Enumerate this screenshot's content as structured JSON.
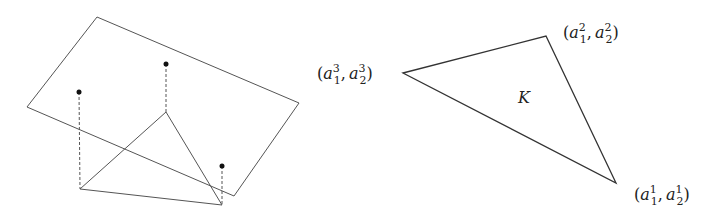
{
  "figure": {
    "left_panel": {
      "description": "plane in 3D with triangle below and three lifted points connected by dashed lines",
      "plane_corners": [
        [
          97,
          17
        ],
        [
          299,
          103
        ],
        [
          234,
          196
        ],
        [
          27,
          107
        ]
      ],
      "triangle_vertices": [
        [
          166,
          112
        ],
        [
          80,
          189
        ],
        [
          222,
          205
        ]
      ],
      "lifted_points": [
        {
          "point": [
            79,
            92
          ],
          "base": [
            80,
            189
          ]
        },
        {
          "point": [
            166,
            64
          ],
          "base": [
            166,
            112
          ]
        },
        {
          "point": [
            222,
            166
          ],
          "base": [
            222,
            205
          ]
        }
      ],
      "stroke_color": "#555555",
      "point_color": "#111111"
    },
    "right_panel": {
      "triangle_vertices": [
        [
          403,
          73
        ],
        [
          546,
          36
        ],
        [
          616,
          183
        ]
      ],
      "region_label": "K",
      "vertex_labels": [
        {
          "id": "v3",
          "base": "a",
          "sub1": "1",
          "sup1": "3",
          "sub2": "2",
          "sup2": "3"
        },
        {
          "id": "v2",
          "base": "a",
          "sub1": "1",
          "sup1": "2",
          "sub2": "2",
          "sup2": "2"
        },
        {
          "id": "v1",
          "base": "a",
          "sub1": "1",
          "sup1": "1",
          "sub2": "2",
          "sup2": "1"
        }
      ],
      "stroke_color": "#333333"
    }
  },
  "labels": {
    "K": "K",
    "open": "(",
    "close": ")",
    "comma": ",",
    "a": "a",
    "v3": {
      "sup1": "3",
      "sub1": "1",
      "sup2": "3",
      "sub2": "2"
    },
    "v2": {
      "sup1": "2",
      "sub1": "1",
      "sup2": "2",
      "sub2": "2"
    },
    "v1": {
      "sup1": "1",
      "sub1": "1",
      "sup2": "1",
      "sub2": "2"
    }
  }
}
